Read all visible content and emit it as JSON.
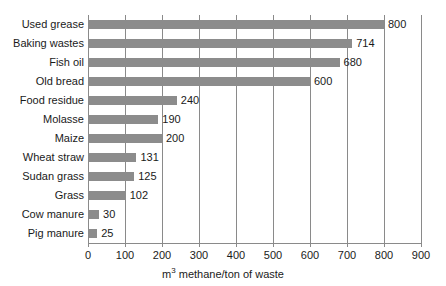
{
  "chart_data": {
    "type": "bar",
    "orientation": "horizontal",
    "title": "",
    "subtitle": "",
    "xlabel": "m³ methane/ton of waste",
    "ylabel": "",
    "xlim": [
      0,
      900
    ],
    "xticks": [
      0,
      100,
      200,
      300,
      400,
      500,
      600,
      700,
      800,
      900
    ],
    "xtick_labels": [
      "0",
      "100",
      "200",
      "300",
      "400",
      "500",
      "600",
      "700",
      "800",
      "900"
    ],
    "grid": true,
    "grid_axis": "x",
    "legend": false,
    "legend_position": "none",
    "bar_color": "#8c8c8c",
    "gridline_color": "#8a8a8a",
    "background_color": "#ffffff",
    "text_color": "#1a1a1a",
    "show_value_labels": true,
    "categories": [
      "Used grease",
      "Baking wastes",
      "Fish oil",
      "Old bread",
      "Food residue",
      "Molasse",
      "Maize",
      "Wheat straw",
      "Sudan grass",
      "Grass",
      "Cow manure",
      "Pig manure"
    ],
    "values": [
      800,
      714,
      680,
      600,
      240,
      190,
      200,
      131,
      125,
      102,
      30,
      25
    ],
    "value_labels": [
      "800",
      "714",
      "680",
      "600",
      "240",
      "190",
      "200",
      "131",
      "125",
      "102",
      "30",
      "25"
    ]
  },
  "axis": {
    "unit_base": "m",
    "unit_exponent": "3",
    "unit_rest": " methane/ton of waste"
  }
}
